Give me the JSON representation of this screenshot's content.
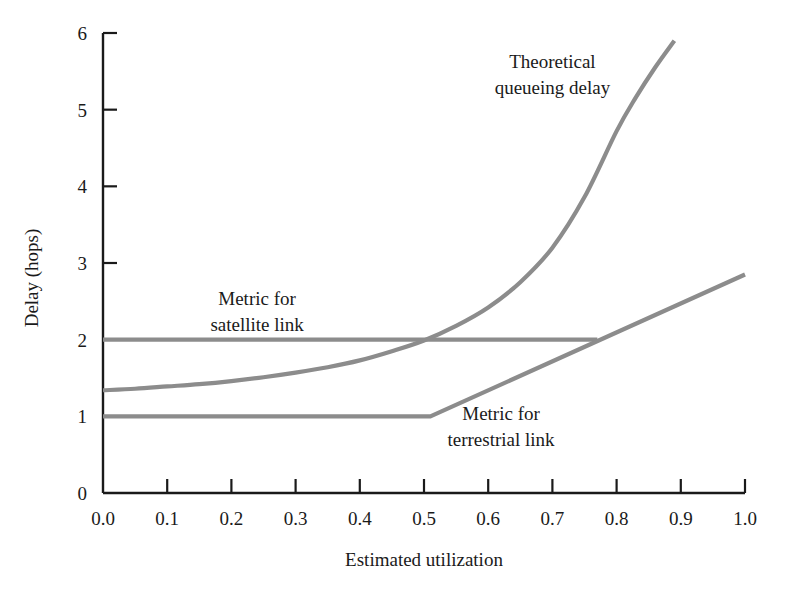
{
  "chart_data": {
    "type": "line",
    "title": "",
    "xlabel": "Estimated utilization",
    "ylabel": "Delay (hops)",
    "xlim": [
      0.0,
      1.0
    ],
    "ylim": [
      0,
      6
    ],
    "grid": false,
    "legend_position": "inline-annotations",
    "xticks": [
      "0.0",
      "0.1",
      "0.2",
      "0.3",
      "0.4",
      "0.5",
      "0.6",
      "0.7",
      "0.8",
      "0.9",
      "1.0"
    ],
    "xtick_values": [
      0.0,
      0.1,
      0.2,
      0.3,
      0.4,
      0.5,
      0.6,
      0.7,
      0.8,
      0.9,
      1.0
    ],
    "yticks": [
      "0",
      "1",
      "2",
      "3",
      "4",
      "5",
      "6"
    ],
    "ytick_values": [
      0,
      1,
      2,
      3,
      4,
      5,
      6
    ],
    "line_color": "#8c8c8c",
    "axis_color": "#1a1a1a",
    "series": [
      {
        "name": "Theoretical queueing delay",
        "x": [
          0.0,
          0.05,
          0.1,
          0.15,
          0.2,
          0.25,
          0.3,
          0.35,
          0.4,
          0.45,
          0.5,
          0.55,
          0.6,
          0.65,
          0.7,
          0.75,
          0.8,
          0.83,
          0.86,
          0.89
        ],
        "values": [
          1.34,
          1.36,
          1.39,
          1.42,
          1.46,
          1.51,
          1.57,
          1.64,
          1.73,
          1.85,
          1.99,
          2.18,
          2.42,
          2.75,
          3.2,
          3.86,
          4.72,
          5.16,
          5.55,
          5.9
        ]
      },
      {
        "name": "Metric for satellite link",
        "x": [
          0.0,
          0.77
        ],
        "values": [
          2.0,
          2.0
        ]
      },
      {
        "name": "Metric for terrestrial link",
        "x": [
          0.0,
          0.51,
          1.0
        ],
        "values": [
          1.0,
          1.0,
          2.85
        ]
      }
    ],
    "annotations": [
      {
        "id": "theoretical-queueing-delay",
        "lines": [
          "Theoretical",
          "queueing delay"
        ],
        "x": 0.7,
        "y": 5.55
      },
      {
        "id": "metric-for-satellite-link",
        "lines": [
          "Metric for",
          "satellite link"
        ],
        "x": 0.24,
        "y": 2.45
      },
      {
        "id": "metric-for-terrestrial-link",
        "lines": [
          "Metric for",
          "terrestrial link"
        ],
        "x": 0.62,
        "y": 0.95
      }
    ]
  }
}
